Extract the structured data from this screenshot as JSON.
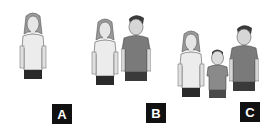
{
  "panels": [
    {
      "label": "A",
      "figures": [
        "woman"
      ]
    },
    {
      "label": "B",
      "figures": [
        "woman",
        "man"
      ]
    },
    {
      "label": "C",
      "figures": [
        "woman",
        "boy",
        "man"
      ]
    }
  ],
  "colors": {
    "label_bg": "#111111",
    "label_fg": "#ffffff",
    "shirt_dark": "#7a7a7a",
    "shirt_light": "#e8e8e8",
    "pants": "#2a2a2a",
    "skin": "#dcdcdc",
    "hair_woman": "#9a9a9a",
    "hair_man": "#3a3a3a"
  }
}
